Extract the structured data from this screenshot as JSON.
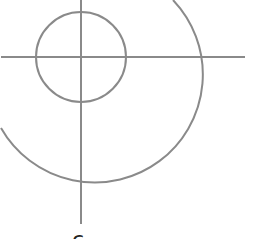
{
  "diagram": {
    "type": "crosshair-with-circles",
    "stroke_color": "#8a8a8a",
    "background": "#ffffff",
    "center": {
      "x": 81,
      "y": 57
    },
    "horizontal_axis": {
      "x1": 1,
      "x2": 245,
      "y": 57
    },
    "vertical_axis": {
      "x": 81,
      "y1": 0,
      "y2": 224
    },
    "inner_circle": {
      "radius": 45
    },
    "outer_arc": {
      "radius": 108,
      "start": {
        "x": 173,
        "y": 0
      },
      "end": {
        "x": 1,
        "y": 128
      }
    },
    "bottom_label": "c"
  }
}
